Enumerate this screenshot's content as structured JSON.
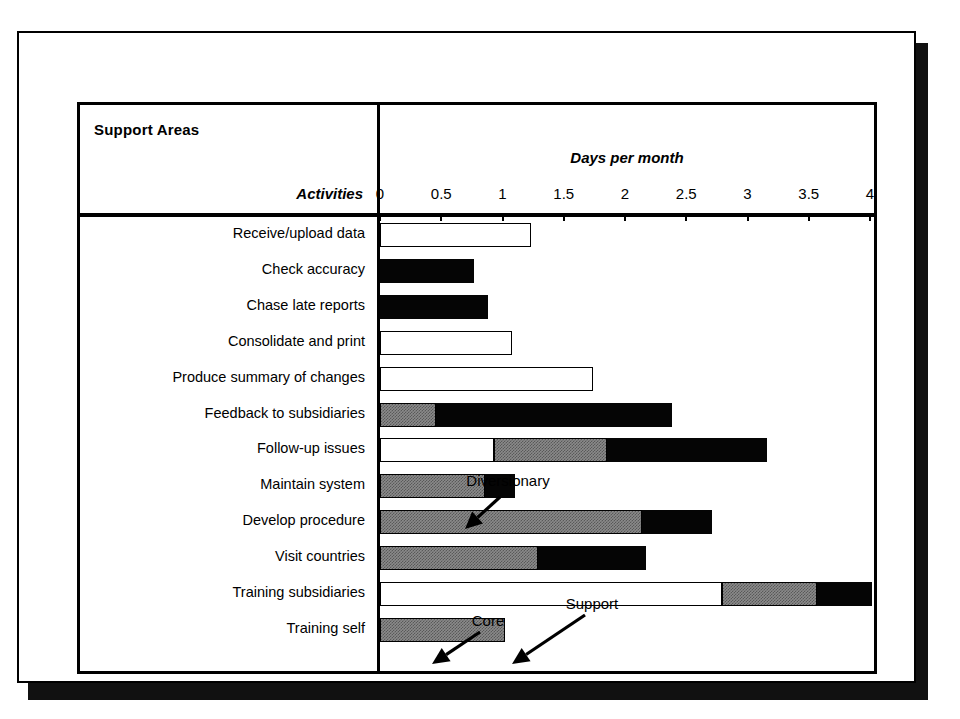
{
  "header": {
    "title": "Support Areas",
    "row_header": "Activities",
    "axis_title": "Days per month"
  },
  "axis": {
    "ticks": [
      "0",
      "0.5",
      "1",
      "1.5",
      "2",
      "2.5",
      "3",
      "3.5",
      "4"
    ],
    "min": 0,
    "max": 4
  },
  "legend_terms": {
    "core": "Core",
    "support": "Support",
    "diversionary": "Diversionary"
  },
  "annotations": [
    {
      "name": "diversionary",
      "label": "Diversionary"
    },
    {
      "name": "core",
      "label": "Core"
    },
    {
      "name": "support",
      "label": "Support"
    }
  ],
  "colors": {
    "core": "#ffffff",
    "support": "#8a8a8a",
    "diversionary": "#050505",
    "outline": "#000000",
    "background": "#ffffff"
  },
  "chart_data": {
    "type": "bar",
    "orientation": "horizontal",
    "stacked": true,
    "title": "Support Areas",
    "xlabel": "Days per month",
    "ylabel": "Activities",
    "xlim": [
      0,
      4
    ],
    "xticks": [
      0,
      0.5,
      1,
      1.5,
      2,
      2.5,
      3,
      3.5,
      4
    ],
    "grid": false,
    "legend_position": "annotated-arrows",
    "categories": [
      "Receive/upload data",
      "Check accuracy",
      "Chase late reports",
      "Consolidate and print",
      "Produce summary of changes",
      "Feedback to subsidiaries",
      "Follow-up issues",
      "Maintain system",
      "Develop procedure",
      "Visit countries",
      "Training subsidiaries",
      "Training self"
    ],
    "series": [
      {
        "name": "Core",
        "values": [
          1.23,
          0,
          0,
          1.08,
          1.74,
          0,
          0.93,
          0,
          0,
          0,
          2.79,
          0
        ]
      },
      {
        "name": "Support",
        "values": [
          0,
          0,
          0,
          0,
          0,
          0.46,
          0.92,
          0.86,
          2.14,
          1.29,
          0.78,
          1.02
        ]
      },
      {
        "name": "Diversionary",
        "values": [
          0,
          0.77,
          0.88,
          0,
          0,
          1.92,
          1.31,
          0.24,
          0.57,
          0.88,
          0.45,
          0
        ]
      }
    ],
    "rows": [
      {
        "label": "Receive/upload data",
        "core": 1.23,
        "support": 0,
        "diversionary": 0,
        "total": 1.23
      },
      {
        "label": "Check accuracy",
        "core": 0,
        "support": 0,
        "diversionary": 0.77,
        "total": 0.77
      },
      {
        "label": "Chase late reports",
        "core": 0,
        "support": 0,
        "diversionary": 0.88,
        "total": 0.88
      },
      {
        "label": "Consolidate and print",
        "core": 1.08,
        "support": 0,
        "diversionary": 0,
        "total": 1.08
      },
      {
        "label": "Produce summary of changes",
        "core": 1.74,
        "support": 0,
        "diversionary": 0,
        "total": 1.74
      },
      {
        "label": "Feedback to subsidiaries",
        "core": 0,
        "support": 0.46,
        "diversionary": 1.92,
        "total": 2.38
      },
      {
        "label": "Follow-up issues",
        "core": 0.93,
        "support": 0.92,
        "diversionary": 1.31,
        "total": 3.16
      },
      {
        "label": "Maintain system",
        "core": 0,
        "support": 0.86,
        "diversionary": 0.24,
        "total": 1.1
      },
      {
        "label": "Develop procedure",
        "core": 0,
        "support": 2.14,
        "diversionary": 0.57,
        "total": 2.71
      },
      {
        "label": "Visit countries",
        "core": 0,
        "support": 1.29,
        "diversionary": 0.88,
        "total": 2.17
      },
      {
        "label": "Training subsidiaries",
        "core": 2.79,
        "support": 0.78,
        "diversionary": 0.45,
        "total": 4.02
      },
      {
        "label": "Training self",
        "core": 0,
        "support": 1.02,
        "diversionary": 0,
        "total": 1.02
      }
    ]
  }
}
